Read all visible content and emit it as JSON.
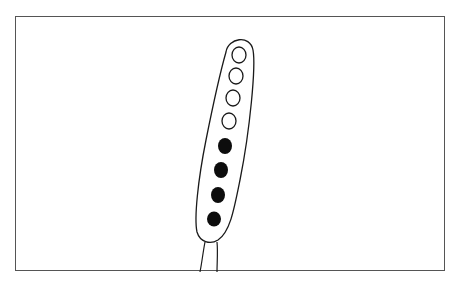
{
  "figure": {
    "outline_color": "#1a1a1a",
    "frame_color": "#555555",
    "background_color": "#ffffff",
    "spores": [
      {
        "index": 1,
        "state": "light",
        "cx": 239,
        "cy": 55
      },
      {
        "index": 2,
        "state": "light",
        "cx": 236,
        "cy": 76
      },
      {
        "index": 3,
        "state": "light",
        "cx": 233,
        "cy": 98
      },
      {
        "index": 4,
        "state": "light",
        "cx": 229,
        "cy": 121
      },
      {
        "index": 5,
        "state": "dark",
        "cx": 225,
        "cy": 146
      },
      {
        "index": 6,
        "state": "dark",
        "cx": 221,
        "cy": 170
      },
      {
        "index": 7,
        "state": "dark",
        "cx": 218,
        "cy": 195
      },
      {
        "index": 8,
        "state": "dark",
        "cx": 214,
        "cy": 219
      }
    ],
    "light_spore_count": 4,
    "dark_spore_count": 4
  }
}
